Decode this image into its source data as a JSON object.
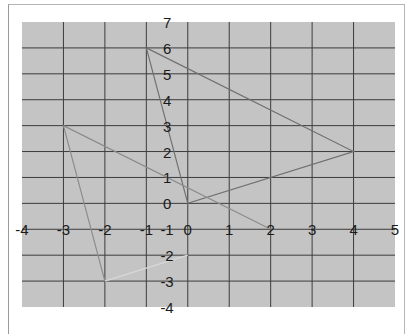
{
  "chart_data": {
    "type": "line",
    "title": "",
    "xlabel": "",
    "ylabel": "",
    "xlim": [
      -4,
      5
    ],
    "ylim": [
      -4,
      7
    ],
    "grid": true,
    "x_ticks": [
      "-4",
      "-3",
      "-2",
      "-1",
      "0",
      "1",
      "2",
      "3",
      "4",
      "5"
    ],
    "y_ticks": [
      "7",
      "6",
      "5",
      "4",
      "3",
      "2",
      "1",
      "0",
      "-1",
      "-2",
      "-3",
      "-4"
    ],
    "series": [
      {
        "name": "triangle",
        "color": "#707070",
        "points": [
          [
            -1,
            6
          ],
          [
            4,
            2
          ],
          [
            0,
            0
          ],
          [
            -1,
            6
          ]
        ]
      },
      {
        "name": "segment-a",
        "color": "#8c8c8c",
        "points": [
          [
            -3,
            3
          ],
          [
            2,
            -1
          ]
        ]
      },
      {
        "name": "segment-b",
        "color": "#8c8c8c",
        "points": [
          [
            -3,
            3
          ],
          [
            -2,
            -3
          ]
        ]
      },
      {
        "name": "segment-c",
        "color": "#d8d8d8",
        "points": [
          [
            -2,
            -3
          ],
          [
            0,
            -2
          ]
        ]
      }
    ],
    "colors": {
      "plot_background": "#c4c4c4",
      "grid": "#3c3c3c"
    }
  }
}
